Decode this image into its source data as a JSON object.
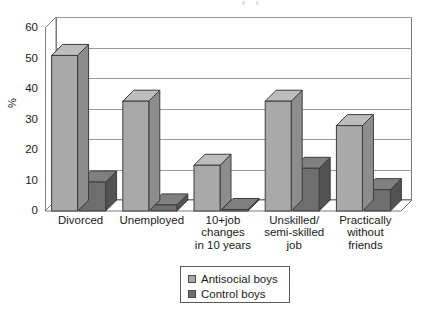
{
  "chart_data": {
    "type": "bar",
    "title": "",
    "subtitle": "",
    "xlabel": "",
    "ylabel": "%",
    "ylim": [
      0,
      60
    ],
    "yticks": [
      0,
      10,
      20,
      30,
      40,
      50,
      60
    ],
    "grid": true,
    "legend_position": "bottom-center",
    "style": "3d-grouped-column",
    "categories": [
      "Divorced",
      "Unemployed",
      "10+job changes in 10 years",
      "Unskilled/semi-skilled job",
      "Practically without friends"
    ],
    "category_lines": [
      [
        "Divorced"
      ],
      [
        "Unemployed"
      ],
      [
        "10+job",
        "changes",
        "in 10 years"
      ],
      [
        "Unskilled/",
        "semi-skilled",
        "job"
      ],
      [
        "Practically",
        "without",
        "friends"
      ]
    ],
    "series": [
      {
        "name": "Antisocial boys",
        "color": "#a9a9a9",
        "values": [
          51,
          36,
          15,
          36,
          28
        ]
      },
      {
        "name": "Control boys",
        "color": "#6e6e6e",
        "values": [
          9.5,
          2,
          0.5,
          14,
          7
        ]
      }
    ]
  },
  "colors": {
    "antisocial_front": "#a9a9a9",
    "antisocial_side": "#8d8d8d",
    "antisocial_top": "#bdbdbd",
    "control_front": "#6e6e6e",
    "control_side": "#525252",
    "control_top": "#808080",
    "gridline": "#9a9a9a",
    "frame": "#7a7a7a",
    "background": "#ffffff",
    "text": "#1a1a1a"
  },
  "legend": {
    "items": [
      {
        "label": "Antisocial boys",
        "color": "#a9a9a9"
      },
      {
        "label": "Control boys",
        "color": "#6e6e6e"
      }
    ]
  }
}
